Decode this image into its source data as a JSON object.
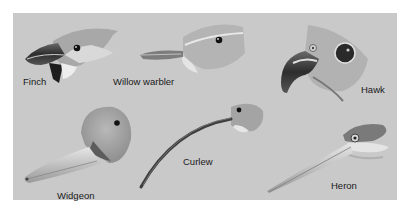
{
  "figure": {
    "background_color": "#c9c9c9",
    "birds": [
      {
        "id": "finch",
        "label": "Finch"
      },
      {
        "id": "willow-warbler",
        "label": "Willow warbler"
      },
      {
        "id": "hawk",
        "label": "Hawk"
      },
      {
        "id": "widgeon",
        "label": "Widgeon"
      },
      {
        "id": "curlew",
        "label": "Curlew"
      },
      {
        "id": "heron",
        "label": "Heron"
      }
    ]
  }
}
